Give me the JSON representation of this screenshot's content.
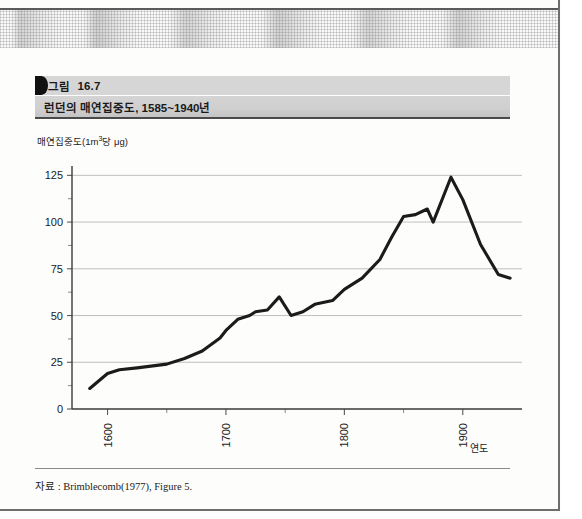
{
  "figure": {
    "label_prefix": "그림",
    "number": "16.7",
    "title": "런던의 매연집중도, 1585~1940년"
  },
  "source": {
    "note": "자료 : Brimblecomb(1977), Figure 5."
  },
  "colors": {
    "caption_band": "#d4d4d4",
    "caption_marker": "#111111",
    "series_line": "#1b1b1b",
    "gridline": "#b9b9b9",
    "axis": "#3a3a3a",
    "page_border": "#6e6e6e"
  },
  "chart_data": {
    "type": "line",
    "title": "런던의 매연집중도, 1585~1940년",
    "xlabel": "연도",
    "ylabel": "매연집중도(1m³당 µg)",
    "ylabel_parts": {
      "pre": "매연집중도(1m",
      "sup": "3",
      "post": "당 μg)"
    },
    "xlim": [
      1570,
      1950
    ],
    "ylim": [
      0,
      130
    ],
    "yticks": [
      0,
      25,
      50,
      75,
      100,
      125
    ],
    "ytick_labels": [
      "0",
      "25",
      "50",
      "75",
      "100",
      "125"
    ],
    "yminor_ticks": [
      12.5,
      37.5,
      62.5,
      87.5,
      112.5
    ],
    "xticks": [
      1600,
      1700,
      1800,
      1900
    ],
    "xtick_labels": [
      "1600",
      "1700",
      "1800",
      "1900"
    ],
    "xminor_ticks": [
      1650,
      1750,
      1850
    ],
    "grid": "horizontal",
    "legend": "none",
    "series": [
      {
        "name": "매연집중도",
        "x": [
          1585,
          1600,
          1610,
          1625,
          1650,
          1665,
          1680,
          1695,
          1700,
          1710,
          1720,
          1725,
          1735,
          1745,
          1755,
          1765,
          1775,
          1790,
          1800,
          1815,
          1830,
          1840,
          1850,
          1860,
          1870,
          1875,
          1890,
          1900,
          1915,
          1930,
          1940
        ],
        "y": [
          11,
          19,
          21,
          22,
          24,
          27,
          31,
          38,
          42,
          48,
          50,
          52,
          53,
          60,
          50,
          52,
          56,
          58,
          64,
          70,
          80,
          92,
          103,
          104,
          107,
          100,
          124,
          112,
          88,
          72,
          70
        ]
      }
    ]
  }
}
